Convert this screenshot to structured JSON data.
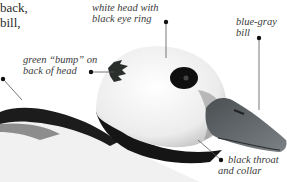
{
  "figure": {
    "cut_text": [
      "back,",
      "bill,"
    ],
    "callouts": [
      {
        "id": "head",
        "lines": [
          "white head with",
          "black eye ring"
        ]
      },
      {
        "id": "bill",
        "lines": [
          "blue-gray",
          "bill"
        ]
      },
      {
        "id": "bump",
        "lines": [
          "green “bump” on",
          "back of head"
        ]
      },
      {
        "id": "throat",
        "lines": [
          "black throat",
          "and collar"
        ]
      }
    ],
    "colors": {
      "text": "#3a3a3a",
      "leader": "#555555",
      "dot": "#111111",
      "bill": "#5e6468",
      "collar": "#151515"
    }
  }
}
